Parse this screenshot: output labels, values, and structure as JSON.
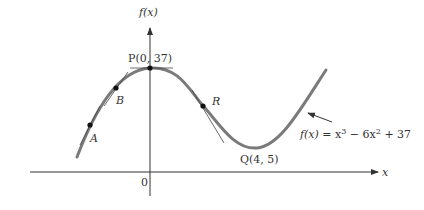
{
  "figure": {
    "function": "f(x) = x^3 - 6x^2 + 37",
    "y_axis_label": "f(x)",
    "x_axis_label": "x",
    "origin_label": "0",
    "points": [
      {
        "name": "A",
        "label": "A"
      },
      {
        "name": "B",
        "label": "B"
      },
      {
        "name": "P",
        "label": "P(0, 37)"
      },
      {
        "name": "R",
        "label": "R"
      },
      {
        "name": "Q",
        "label": "Q(4, 5)"
      }
    ],
    "curve_label": {
      "lhs": "f(x)",
      "eq": " = x",
      "exp1": "3",
      "mid": " − 6x",
      "exp2": "2",
      "tail": " + 37"
    },
    "colors": {
      "curve": "#7a7a7a",
      "axes": "#333333",
      "tangent": "#444444"
    }
  }
}
